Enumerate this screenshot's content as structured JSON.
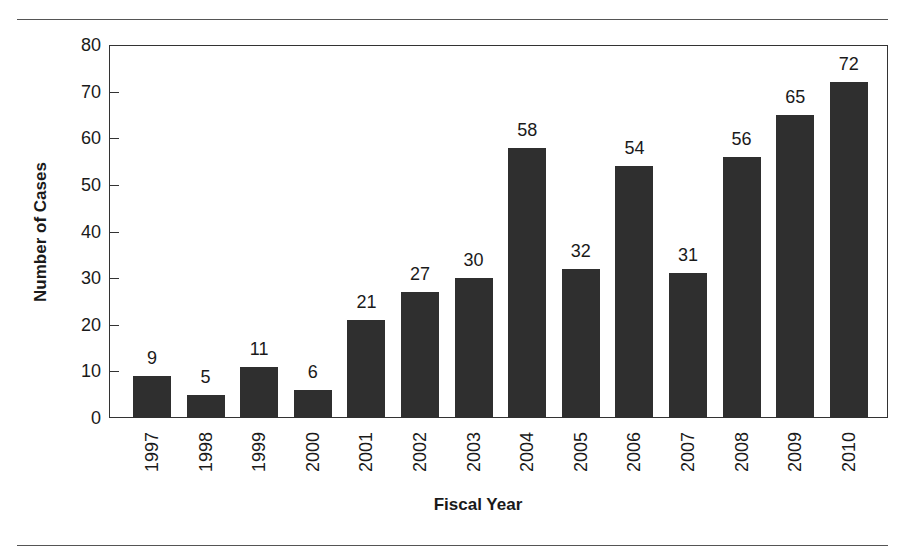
{
  "chart_data": {
    "type": "bar",
    "title": "",
    "xlabel": "Fiscal Year",
    "ylabel": "Number of Cases",
    "ylim": [
      0,
      80
    ],
    "yticks": [
      0,
      10,
      20,
      30,
      40,
      50,
      60,
      70,
      80
    ],
    "grid": false,
    "legend": null,
    "bar_color": "#2f2f2f",
    "categories": [
      "1997",
      "1998",
      "1999",
      "2000",
      "2001",
      "2002",
      "2003",
      "2004",
      "2005",
      "2006",
      "2007",
      "2008",
      "2009",
      "2010"
    ],
    "values": [
      9,
      5,
      11,
      6,
      21,
      27,
      30,
      58,
      32,
      54,
      31,
      56,
      65,
      72
    ]
  }
}
